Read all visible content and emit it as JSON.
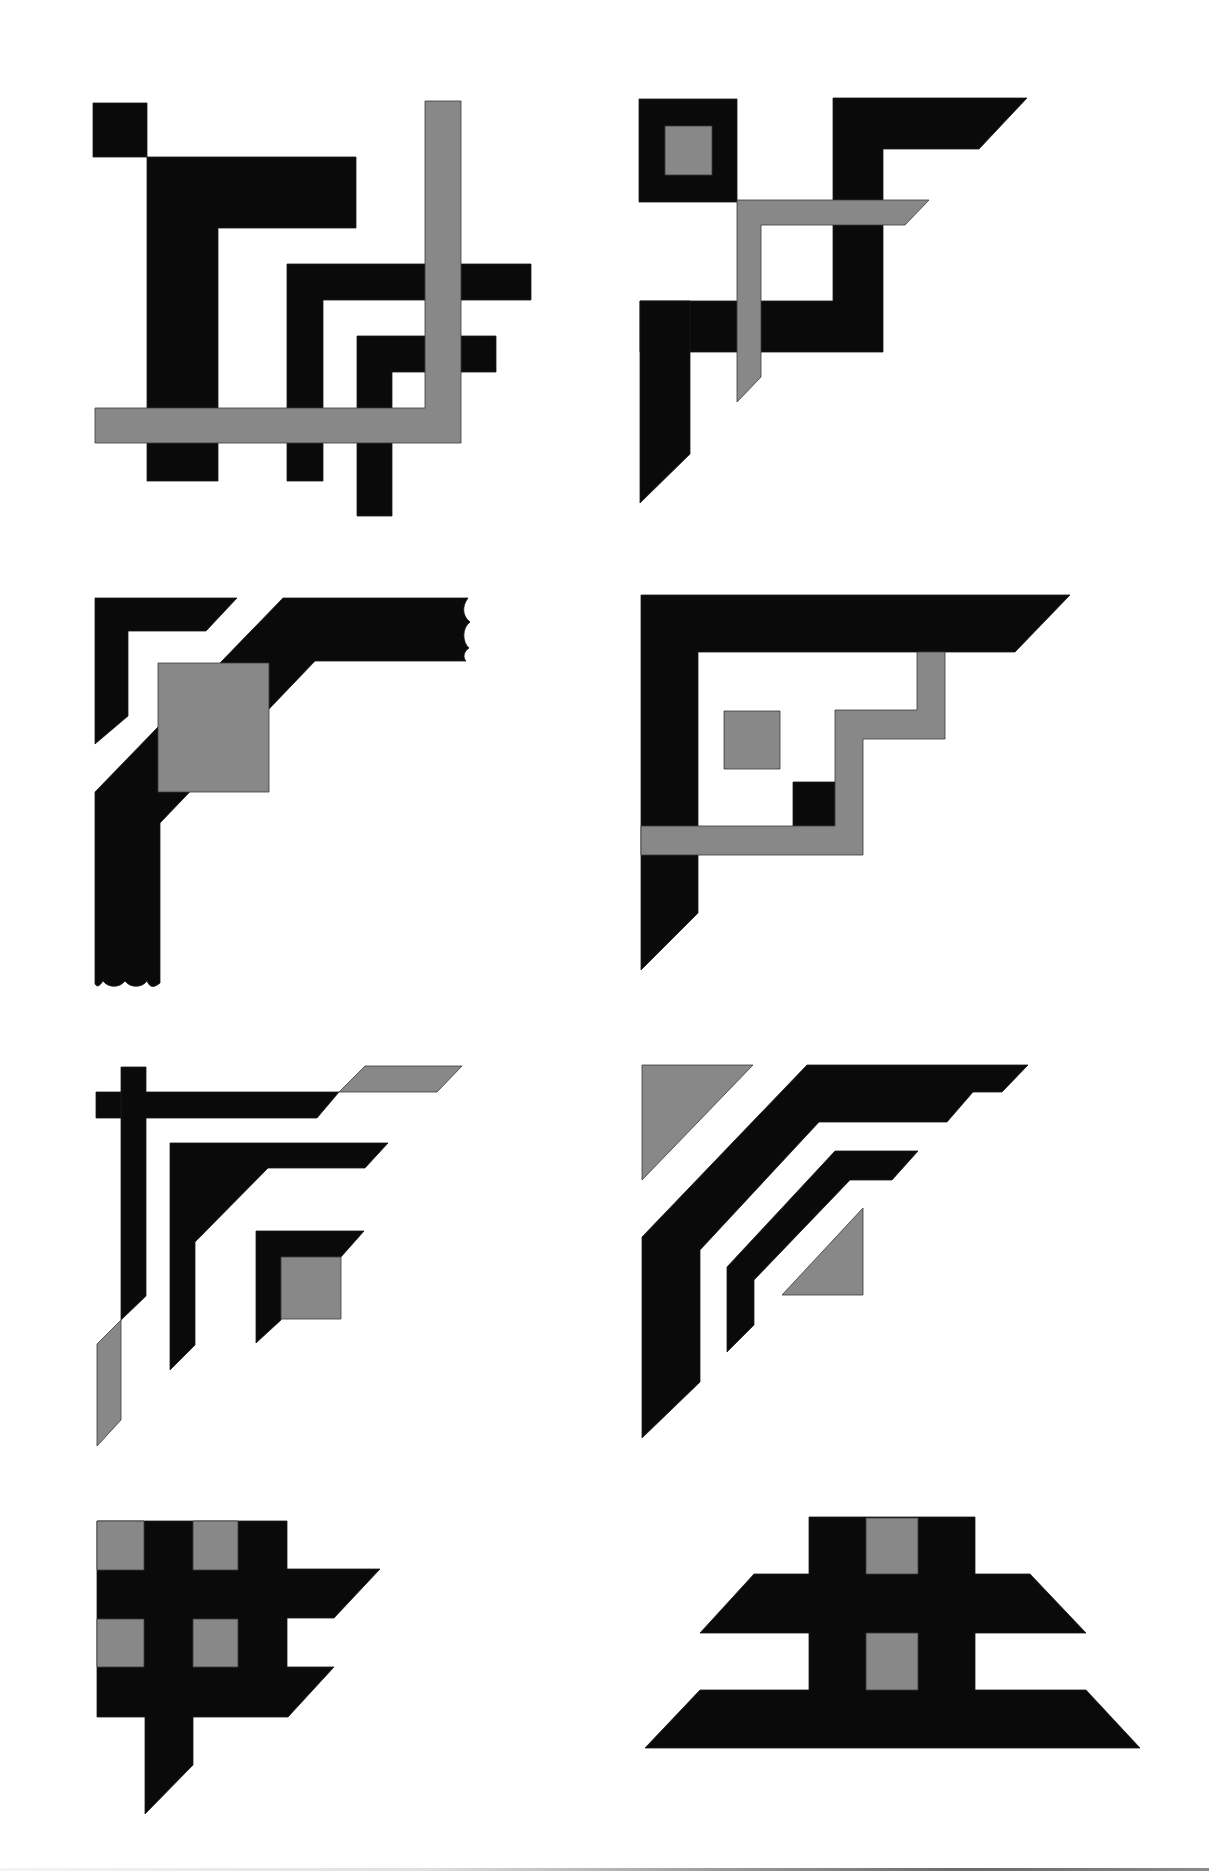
{
  "page": {
    "background": "#ffffff",
    "colors": {
      "black": "#0a0a0a",
      "gray": "#888888"
    },
    "size": [
      1209,
      1874
    ]
  },
  "ornaments": [
    {
      "id": "ornament-1",
      "name": "interlaced-square-corner",
      "shapes": [
        {
          "fill": "black",
          "points": "93,103 147,103 147,157 93,157"
        },
        {
          "fill": "black",
          "points": "147,157 356,157 356,228 218,228 218,481 147,481"
        },
        {
          "fill": "black",
          "points": "287,264 531,264 531,300 323,300 323,481 287,481"
        },
        {
          "fill": "black",
          "points": "357,336 496,336 496,372 392,372 392,516 357,516"
        },
        {
          "fill": "gray",
          "points": "425,101 461,101 461,443 95,443 95,408 425,408"
        }
      ]
    },
    {
      "id": "ornament-2",
      "name": "key-square-corner",
      "shapes": [
        {
          "fill": "black",
          "points": "639,99 737,99 737,202 639,202"
        },
        {
          "fill": "gray",
          "points": "665,126 712,126 712,175 665,175"
        },
        {
          "fill": "black",
          "points": "833,98 1027,98 979,149 883,149 883,352 640,352 640,301 833,301"
        },
        {
          "fill": "black",
          "points": "640,301 690,301 690,454 640,503"
        },
        {
          "fill": "gray",
          "points": "737,200 929,200 905,225 761,225 761,377 737,402"
        }
      ]
    },
    {
      "id": "ornament-3",
      "name": "diagonal-band-corner",
      "shapes": [
        {
          "fill": "black",
          "points": "95,598 237,598 206,631 128,631 128,716 95,744"
        },
        {
          "fill": "gray",
          "points": "158,663 269,663 269,792 158,792"
        }
      ],
      "band_path": "M95,792 L283,598 L468,598 C462,606 462,616 470,622 C462,628 462,642 469,648 C463,652 463,658 466,661 L315,661 L160,823 L160,983 C154,988 150,988 147,981 C142,988 130,988 125,981 C120,988 108,988 103,981 C99,987 97,987 95,984 Z"
    },
    {
      "id": "ornament-4",
      "name": "stepped-frame-corner",
      "shapes": [
        {
          "fill": "black",
          "points": "641,595 1070,595 1015,652 698,652 698,913 641,970"
        },
        {
          "fill": "gray",
          "points": "724,711 780,711 780,769 724,769"
        },
        {
          "fill": "black",
          "points": "793,782 835,782 835,826 793,826"
        },
        {
          "fill": "gray",
          "points": "917,652 945,652 945,739 863,739 863,855 641,855 641,826 835,826 835,710 917,710"
        }
      ]
    },
    {
      "id": "ornament-5",
      "name": "cross-and-chevrons-corner",
      "shapes": [
        {
          "fill": "black",
          "points": "121,1067 146,1067 146,1092 339,1092 317,1118 146,1118 146,1296 121,1320"
        },
        {
          "fill": "black",
          "points": "96,1092 121,1092 121,1118 96,1118"
        },
        {
          "fill": "gray",
          "points": "339,1092 365,1066 462,1066 437,1092"
        },
        {
          "fill": "gray",
          "points": "97,1344 121,1320 121,1420 97,1446"
        },
        {
          "fill": "black",
          "points": "170,1143 388,1143 365,1168 268,1168 195,1242 195,1345 170,1370"
        },
        {
          "fill": "black",
          "points": "256,1231 364,1231 341,1257 281,1257 281,1320 256,1343"
        },
        {
          "fill": "gray",
          "points": "281,1257 341,1257 341,1319 281,1319"
        }
      ]
    },
    {
      "id": "ornament-6",
      "name": "triple-diagonal-corner",
      "shapes": [
        {
          "fill": "gray",
          "points": "642,1065 753,1065 642,1180"
        },
        {
          "fill": "black",
          "points": "642,1237 807,1065 1028,1065 1002,1092 973,1092 947,1122 819,1122 700,1250 700,1382 642,1438"
        },
        {
          "fill": "black",
          "points": "727,1267 835,1151 918,1151 892,1180 850,1180 754,1280 754,1325 727,1352"
        },
        {
          "fill": "gray",
          "points": "863,1208 863,1295 782,1295"
        }
      ]
    },
    {
      "id": "ornament-7",
      "name": "grid-block-corner",
      "shapes": [
        {
          "fill": "black",
          "points": "97,1521 287,1521 287,1569 380,1569 334,1618 287,1618 287,1667 334,1667 288,1717 193,1717 193,1765 145,1814 145,1717 97,1717"
        },
        {
          "fill": "gray",
          "points": "97,1521 144,1521 144,1570 97,1570"
        },
        {
          "fill": "gray",
          "points": "193,1521 238,1521 238,1570 193,1570"
        },
        {
          "fill": "gray",
          "points": "97,1619 144,1619 144,1667 97,1667"
        },
        {
          "fill": "gray",
          "points": "193,1619 238,1619 238,1667 193,1667"
        }
      ]
    },
    {
      "id": "ornament-8",
      "name": "pagoda-border-element",
      "shapes": [
        {
          "fill": "black",
          "points": "809,1517 975,1517 975,1574 1030,1574 1086,1633 975,1633 975,1690 1086,1690 1140,1748 645,1748 700,1690 809,1690 809,1633 700,1633 754,1574 809,1574"
        },
        {
          "fill": "gray",
          "points": "866,1518 918,1518 918,1574 866,1574"
        },
        {
          "fill": "gray",
          "points": "866,1633 918,1633 918,1690 866,1690"
        }
      ]
    }
  ]
}
